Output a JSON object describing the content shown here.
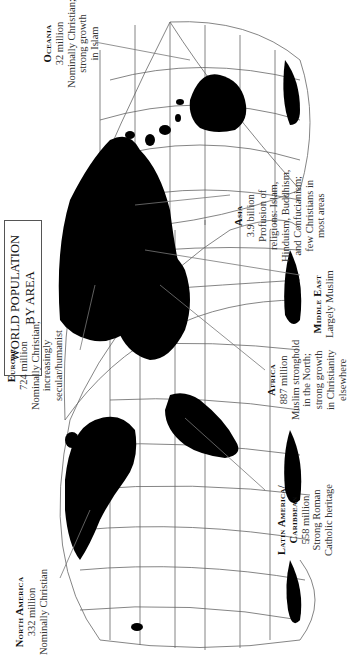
{
  "title": {
    "line1": "WORLD POPULATION",
    "line2": "BY AREA"
  },
  "orientation": "rotated 90° counter-clockwise",
  "regions": [
    {
      "id": "oceania",
      "name": "Oceania",
      "lines": [
        "32 million",
        "Nominally Christian;",
        "strong growth",
        "in Islam"
      ]
    },
    {
      "id": "asia",
      "name": "Asia",
      "lines": [
        "3.9 billion",
        "Profusion of",
        "religions: Islam,",
        "Hinduism, Buddhism,",
        "and Confucianism;",
        "few Christians in",
        "most areas"
      ]
    },
    {
      "id": "middle-east",
      "name": "Middle East",
      "lines": [
        "Largely Muslim"
      ]
    },
    {
      "id": "africa",
      "name": "Africa",
      "lines": [
        "887 million",
        "Muslim stronghold",
        "in the North;",
        "strong growth",
        "in Christianity",
        "elsewhere"
      ]
    },
    {
      "id": "europe",
      "name": "Europe",
      "lines": [
        "724 million",
        "Nominally Christian;",
        "increasingly",
        "secular/humanist"
      ]
    },
    {
      "id": "latin-america",
      "name": "Latin America/",
      "name2": "Caribbean",
      "lines": [
        "558 million",
        "Strong Roman",
        "Catholic heritage"
      ]
    },
    {
      "id": "north-america",
      "name": "North America",
      "lines": [
        "332 million",
        "Nominally Christian"
      ]
    }
  ],
  "colors": {
    "land": "#000000",
    "grid": "#555555",
    "background": "#ffffff",
    "text": "#222222"
  }
}
